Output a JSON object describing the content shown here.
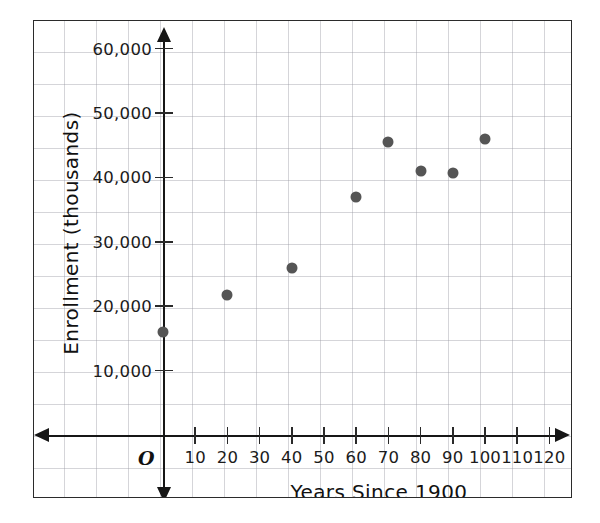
{
  "chart_data": {
    "type": "scatter",
    "title": "",
    "xlabel": "Years Since 1900",
    "ylabel": "Enrollment (thousands)",
    "origin_label": "O",
    "xlim": [
      0,
      130
    ],
    "ylim": [
      0,
      65000
    ],
    "grid": true,
    "legend": "none",
    "x_ticks": [
      10,
      20,
      30,
      40,
      50,
      60,
      70,
      80,
      90,
      100,
      110,
      120
    ],
    "x_tick_labels": [
      "10",
      "20",
      "30",
      "40",
      "50",
      "60",
      "70",
      "80",
      "90",
      "100",
      "110",
      "120"
    ],
    "y_ticks": [
      10000,
      20000,
      30000,
      40000,
      50000,
      60000
    ],
    "y_tick_labels": [
      "10,000",
      "20,000",
      "30,000",
      "40,000",
      "50,000",
      "60,000"
    ],
    "marker_color": "#555555",
    "axis_color": "#161616",
    "grid_color": "#9696a0",
    "points": [
      {
        "x": 0,
        "y": 16000
      },
      {
        "x": 20,
        "y": 21800
      },
      {
        "x": 40,
        "y": 26000
      },
      {
        "x": 60,
        "y": 37000
      },
      {
        "x": 70,
        "y": 45500
      },
      {
        "x": 80,
        "y": 41000
      },
      {
        "x": 90,
        "y": 40700
      },
      {
        "x": 100,
        "y": 46000
      }
    ]
  }
}
